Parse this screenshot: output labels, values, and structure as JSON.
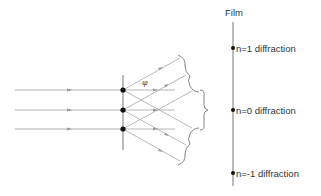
{
  "diagram": {
    "film_label": "Film",
    "angle_label": "φ",
    "orders": [
      {
        "order": 1,
        "label": "n=1 diffraction",
        "film_y": 48
      },
      {
        "order": 0,
        "label": "n=0 diffraction",
        "film_y": 110
      },
      {
        "order": -1,
        "label": "n=-1 diffraction",
        "film_y": 173
      }
    ],
    "grating": {
      "x": 123,
      "top": 75,
      "bottom": 150,
      "slit_ys": [
        90,
        110,
        129
      ]
    },
    "incoming_rays": {
      "start_x": 15,
      "arrow_x": 70
    },
    "film": {
      "x": 233,
      "top": 22,
      "bottom": 186
    },
    "colors": {
      "line": "#9a9a9a",
      "axis": "#777777",
      "dot": "#111111",
      "text": "#333333"
    }
  }
}
